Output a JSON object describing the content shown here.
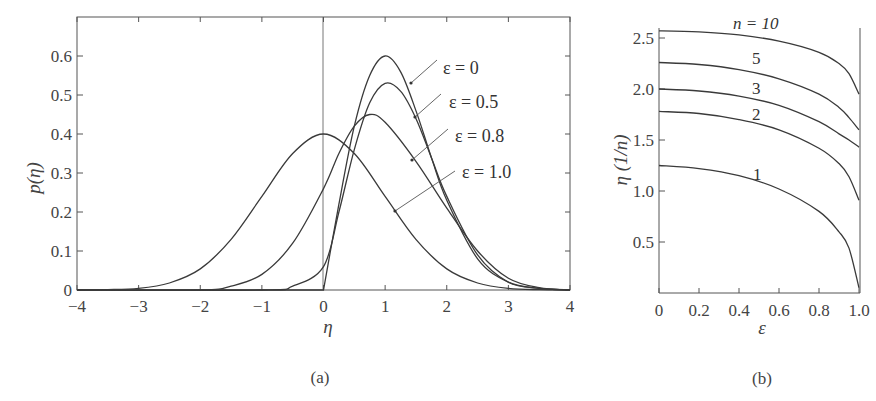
{
  "chart_data": [
    {
      "panel": "(a)",
      "type": "line",
      "title": "",
      "xlabel": "η",
      "ylabel": "p(η)",
      "xlim": [
        -4,
        4
      ],
      "ylim": [
        0,
        0.7
      ],
      "xticks": [
        -4,
        -3,
        -2,
        -1,
        0,
        1,
        2,
        3,
        4
      ],
      "xtick_labels": [
        "−4",
        "−3",
        "−2",
        "−1",
        "0",
        "1",
        "2",
        "3",
        "4"
      ],
      "yticks": [
        0,
        0.1,
        0.2,
        0.3,
        0.4,
        0.5,
        0.6
      ],
      "ytick_labels": [
        "0",
        "0.1",
        "0.2",
        "0.3",
        "0.4",
        "0.5",
        "0.6"
      ],
      "grid": false,
      "vertical_reference_line_at_x": 0,
      "series": [
        {
          "name": "ε = 0",
          "peak": {
            "x": 1.0,
            "y": 0.6
          },
          "x": [
            0,
            0.25,
            0.5,
            0.75,
            1.0,
            1.25,
            1.5,
            1.75,
            2.0,
            2.5,
            3.0,
            3.5,
            4.0
          ],
          "y": [
            0,
            0.22,
            0.42,
            0.55,
            0.6,
            0.56,
            0.46,
            0.34,
            0.23,
            0.08,
            0.02,
            0.004,
            0
          ]
        },
        {
          "name": "ε = 0.5",
          "peak": {
            "x": 0.95,
            "y": 0.53
          },
          "x": [
            -1.0,
            -0.5,
            0,
            0.25,
            0.5,
            0.75,
            1.0,
            1.25,
            1.5,
            1.75,
            2.0,
            2.5,
            3.0,
            3.5,
            4.0
          ],
          "y": [
            0,
            0.01,
            0.06,
            0.2,
            0.36,
            0.48,
            0.53,
            0.51,
            0.44,
            0.34,
            0.24,
            0.09,
            0.02,
            0.004,
            0
          ]
        },
        {
          "name": "ε = 0.8",
          "peak": {
            "x": 0.73,
            "y": 0.45
          },
          "x": [
            -2.0,
            -1.5,
            -1.0,
            -0.5,
            0,
            0.25,
            0.5,
            0.75,
            1.0,
            1.5,
            2.0,
            2.5,
            3.0,
            3.5,
            4.0
          ],
          "y": [
            0,
            0.01,
            0.04,
            0.12,
            0.26,
            0.35,
            0.42,
            0.45,
            0.43,
            0.33,
            0.21,
            0.1,
            0.03,
            0.006,
            0
          ]
        },
        {
          "name": "ε = 1.0",
          "peak": {
            "x": 0.0,
            "y": 0.4
          },
          "x": [
            -3.5,
            -3.0,
            -2.5,
            -2.0,
            -1.5,
            -1.0,
            -0.5,
            0,
            0.5,
            1.0,
            1.5,
            2.0,
            2.5,
            3.0,
            3.5,
            4.0
          ],
          "y": [
            0.001,
            0.004,
            0.018,
            0.054,
            0.13,
            0.24,
            0.35,
            0.4,
            0.35,
            0.24,
            0.13,
            0.054,
            0.018,
            0.004,
            0.001,
            0
          ]
        }
      ],
      "annotations": [
        "ε = 0",
        "ε = 0.5",
        "ε = 0.8",
        "ε = 1.0"
      ]
    },
    {
      "panel": "(b)",
      "type": "line",
      "title": "",
      "xlabel": "ε",
      "ylabel": "η (1/n)",
      "xlim": [
        0,
        1.0
      ],
      "ylim": [
        0,
        2.6
      ],
      "xticks": [
        0,
        0.2,
        0.4,
        0.6,
        0.8,
        1.0
      ],
      "xtick_labels": [
        "0",
        "0.2",
        "0.4",
        "0.6",
        "0.8",
        "1.0"
      ],
      "yticks": [
        0.5,
        1.0,
        1.5,
        2.0,
        2.5
      ],
      "ytick_labels": [
        "0.5",
        "1.0",
        "1.5",
        "2.0",
        "2.5"
      ],
      "grid": false,
      "series": [
        {
          "name": "n = 10",
          "x": [
            0,
            0.2,
            0.4,
            0.6,
            0.8,
            0.9,
            0.95,
            1.0
          ],
          "y": [
            2.57,
            2.56,
            2.53,
            2.47,
            2.36,
            2.25,
            2.15,
            1.95
          ]
        },
        {
          "name": "5",
          "x": [
            0,
            0.2,
            0.4,
            0.6,
            0.8,
            0.9,
            0.95,
            1.0
          ],
          "y": [
            2.26,
            2.24,
            2.19,
            2.1,
            1.95,
            1.82,
            1.72,
            1.6
          ]
        },
        {
          "name": "3",
          "x": [
            0,
            0.2,
            0.4,
            0.6,
            0.8,
            0.9,
            0.95,
            1.0
          ],
          "y": [
            2.0,
            1.98,
            1.93,
            1.84,
            1.68,
            1.56,
            1.5,
            1.43
          ]
        },
        {
          "name": "2",
          "x": [
            0,
            0.2,
            0.4,
            0.6,
            0.8,
            0.9,
            0.95,
            1.0
          ],
          "y": [
            1.78,
            1.76,
            1.7,
            1.6,
            1.42,
            1.27,
            1.14,
            0.91
          ]
        },
        {
          "name": "1",
          "x": [
            0,
            0.2,
            0.4,
            0.6,
            0.8,
            0.9,
            0.95,
            1.0
          ],
          "y": [
            1.25,
            1.22,
            1.15,
            1.02,
            0.8,
            0.6,
            0.44,
            0.05
          ]
        }
      ],
      "annotations": [
        "n = 10",
        "5",
        "3",
        "2",
        "1"
      ]
    }
  ],
  "labels": {
    "a": {
      "ylabel": "p(η)",
      "xlabel": "η",
      "panel": "(a)",
      "series": [
        "ε = 0",
        "ε = 0.5",
        "ε = 0.8",
        "ε = 1.0"
      ],
      "xticks": [
        "−4",
        "−3",
        "−2",
        "−1",
        "0",
        "1",
        "2",
        "3",
        "4"
      ],
      "yticks": [
        "0",
        "0.1",
        "0.2",
        "0.3",
        "0.4",
        "0.5",
        "0.6"
      ]
    },
    "b": {
      "ylabel": "η (1/n)",
      "xlabel": "ε",
      "panel": "(b)",
      "series": [
        "n = 10",
        "5",
        "3",
        "2",
        "1"
      ],
      "xticks": [
        "0",
        "0.2",
        "0.4",
        "0.6",
        "0.8",
        "1.0"
      ],
      "yticks": [
        "0.5",
        "1.0",
        "1.5",
        "2.0",
        "2.5"
      ]
    }
  }
}
